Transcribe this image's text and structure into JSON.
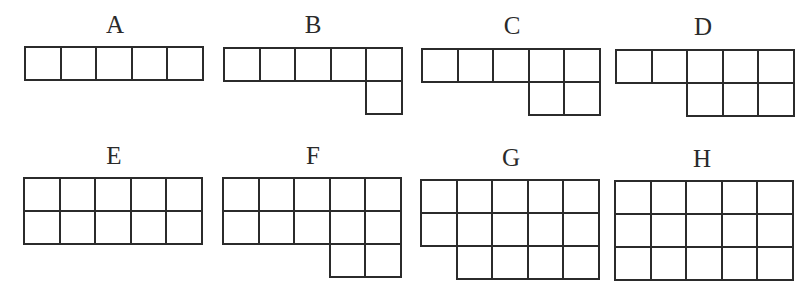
{
  "diagram": {
    "cell": {
      "width": 35.6,
      "height": 33
    },
    "line_color": "#2b2b2b",
    "label_color": "#2a2a2a",
    "figures": [
      {
        "label": "A",
        "label_pos": {
          "x": 95,
          "y": 12
        },
        "grid_pos": {
          "x": 24,
          "y": 46
        },
        "rows": [
          [
            0,
            1,
            2,
            3,
            4
          ]
        ],
        "cell_count": 5
      },
      {
        "label": "B",
        "label_pos": {
          "x": 293,
          "y": 12
        },
        "grid_pos": {
          "x": 223,
          "y": 47
        },
        "rows": [
          [
            0,
            1,
            2,
            3,
            4
          ],
          [
            4
          ]
        ],
        "cell_count": 6
      },
      {
        "label": "C",
        "label_pos": {
          "x": 492,
          "y": 13
        },
        "grid_pos": {
          "x": 421,
          "y": 48
        },
        "rows": [
          [
            0,
            1,
            2,
            3,
            4
          ],
          [
            3,
            4
          ]
        ],
        "cell_count": 7
      },
      {
        "label": "D",
        "label_pos": {
          "x": 683,
          "y": 14
        },
        "grid_pos": {
          "x": 615,
          "y": 49
        },
        "rows": [
          [
            0,
            1,
            2,
            3,
            4
          ],
          [
            2,
            3,
            4
          ]
        ],
        "cell_count": 8
      },
      {
        "label": "E",
        "label_pos": {
          "x": 94,
          "y": 143
        },
        "grid_pos": {
          "x": 23,
          "y": 177
        },
        "rows": [
          [
            0,
            1,
            2,
            3,
            4
          ],
          [
            0,
            1,
            2,
            3,
            4
          ]
        ],
        "cell_count": 10
      },
      {
        "label": "F",
        "label_pos": {
          "x": 293,
          "y": 143
        },
        "grid_pos": {
          "x": 222,
          "y": 177
        },
        "rows": [
          [
            0,
            1,
            2,
            3,
            4
          ],
          [
            0,
            1,
            2,
            3,
            4
          ],
          [
            3,
            4
          ]
        ],
        "cell_count": 12
      },
      {
        "label": "G",
        "label_pos": {
          "x": 491,
          "y": 145
        },
        "grid_pos": {
          "x": 420,
          "y": 179
        },
        "rows": [
          [
            0,
            1,
            2,
            3,
            4
          ],
          [
            0,
            1,
            2,
            3,
            4
          ],
          [
            1,
            2,
            3,
            4
          ]
        ],
        "cell_count": 14
      },
      {
        "label": "H",
        "label_pos": {
          "x": 682,
          "y": 146
        },
        "grid_pos": {
          "x": 614,
          "y": 180
        },
        "rows": [
          [
            0,
            1,
            2,
            3,
            4
          ],
          [
            0,
            1,
            2,
            3,
            4
          ],
          [
            0,
            1,
            2,
            3,
            4
          ]
        ],
        "cell_count": 15
      }
    ]
  }
}
